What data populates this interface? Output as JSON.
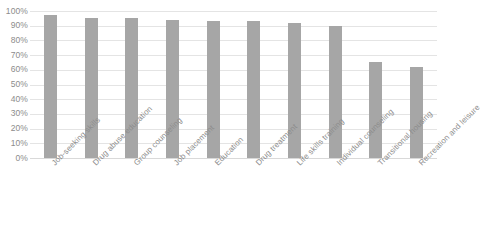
{
  "chart_data": {
    "type": "bar",
    "title": "",
    "subtitle": "",
    "xlabel": "",
    "ylabel": "",
    "categories": [
      "Job-seeking skills",
      "Drug abuse education",
      "Group counseling",
      "Job placement",
      "Education",
      "Drug treatment",
      "Life skills training",
      "Individual counseling",
      "Transitional housing",
      "Recreation and leisure"
    ],
    "values": [
      97,
      95,
      95,
      94,
      93,
      93,
      92,
      90,
      65,
      62
    ],
    "value_unit": "%",
    "ylim": [
      0,
      100
    ],
    "ytick_labels": [
      "100%",
      "90%",
      "80%",
      "70%",
      "60%",
      "50%",
      "40%",
      "30%",
      "20%",
      "10%",
      "0%"
    ],
    "ytick_values": [
      100,
      90,
      80,
      70,
      60,
      50,
      40,
      30,
      20,
      10,
      0
    ],
    "grid": true,
    "legend": false,
    "legend_position": "none",
    "bar_color": "#a6a6a6",
    "gridline_color": "#e4e4e4",
    "axis_text_color": "#8c8c8c",
    "background_color": "#ffffff",
    "category_label_rotation": -45
  }
}
